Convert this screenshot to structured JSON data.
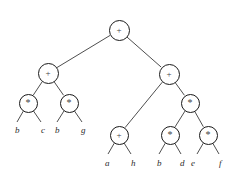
{
  "figure": {
    "type": "expression-tree",
    "background_color": "#ffffff",
    "node_stroke_color": "#1a1a1a",
    "edge_color": "#3a3a3a",
    "leaf_text_color": "#2b2b2b"
  },
  "symbols": {
    "plus": "+",
    "times": "*"
  },
  "nodes": [
    {
      "id": "n0",
      "label": "+",
      "kind": "plus",
      "cx": 119,
      "cy": 30,
      "r": 10.5
    },
    {
      "id": "n1",
      "label": "+",
      "kind": "plus",
      "cx": 48,
      "cy": 73,
      "r": 10.5
    },
    {
      "id": "n2",
      "label": "+",
      "kind": "plus",
      "cx": 169,
      "cy": 74,
      "r": 10.5
    },
    {
      "id": "n3",
      "label": "*",
      "kind": "times",
      "cx": 28,
      "cy": 103,
      "r": 9.5
    },
    {
      "id": "n4",
      "label": "*",
      "kind": "times",
      "cx": 69,
      "cy": 103,
      "r": 9.5
    },
    {
      "id": "n5",
      "label": "*",
      "kind": "times",
      "cx": 190,
      "cy": 103,
      "r": 9.5
    },
    {
      "id": "n6",
      "label": "+",
      "kind": "plus",
      "cx": 119,
      "cy": 135,
      "r": 9.5
    },
    {
      "id": "n7",
      "label": "*",
      "kind": "times",
      "cx": 170,
      "cy": 135,
      "r": 9.5
    },
    {
      "id": "n8",
      "label": "*",
      "kind": "times",
      "cx": 208,
      "cy": 135,
      "r": 9.5
    }
  ],
  "edges": [
    {
      "from": "n0",
      "to": "n1"
    },
    {
      "from": "n0",
      "to": "n2"
    },
    {
      "from": "n1",
      "to": "n3"
    },
    {
      "from": "n1",
      "to": "n4"
    },
    {
      "from": "n2",
      "to": "n6"
    },
    {
      "from": "n2",
      "to": "n5"
    },
    {
      "from": "n5",
      "to": "n7"
    },
    {
      "from": "n5",
      "to": "n8"
    },
    {
      "from": "n3",
      "to": "l1"
    },
    {
      "from": "n3",
      "to": "l2"
    },
    {
      "from": "n4",
      "to": "l3"
    },
    {
      "from": "n4",
      "to": "l4"
    },
    {
      "from": "n6",
      "to": "l5"
    },
    {
      "from": "n6",
      "to": "l6"
    },
    {
      "from": "n7",
      "to": "l7"
    },
    {
      "from": "n7",
      "to": "l8"
    },
    {
      "from": "n8",
      "to": "l9"
    },
    {
      "from": "n8",
      "to": "l10"
    }
  ],
  "leaves": [
    {
      "id": "l1",
      "label": "b",
      "x": 15,
      "y": 125,
      "tip_x": 17,
      "tip_y": 122
    },
    {
      "id": "l2",
      "label": "c",
      "x": 41,
      "y": 125,
      "tip_x": 41,
      "tip_y": 122
    },
    {
      "id": "l3",
      "label": "b",
      "x": 55,
      "y": 125,
      "tip_x": 57,
      "tip_y": 122
    },
    {
      "id": "l4",
      "label": "g",
      "x": 81,
      "y": 125,
      "tip_x": 82,
      "tip_y": 122
    },
    {
      "id": "l5",
      "label": "a",
      "x": 105,
      "y": 158,
      "tip_x": 108,
      "tip_y": 154
    },
    {
      "id": "l6",
      "label": "h",
      "x": 131,
      "y": 158,
      "tip_x": 131,
      "tip_y": 154
    },
    {
      "id": "l7",
      "label": "b",
      "x": 157,
      "y": 158,
      "tip_x": 159,
      "tip_y": 154
    },
    {
      "id": "l8",
      "label": "d",
      "x": 180,
      "y": 158,
      "tip_x": 181,
      "tip_y": 154
    },
    {
      "id": "l9",
      "label": "e",
      "x": 191,
      "y": 158,
      "tip_x": 197,
      "tip_y": 154
    },
    {
      "id": "l10",
      "label": "f",
      "x": 219,
      "y": 158,
      "tip_x": 219,
      "tip_y": 154
    }
  ]
}
